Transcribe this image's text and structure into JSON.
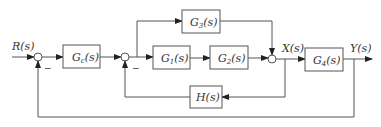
{
  "diagram": {
    "type": "block-diagram",
    "signals": {
      "input": "R(s)",
      "intermediate": "X(s)",
      "output": "Y(s)"
    },
    "blocks": {
      "gc": {
        "main": "G",
        "sub": "c",
        "arg": "(s)"
      },
      "g1": {
        "main": "G",
        "sub": "1",
        "arg": "(s)"
      },
      "g2": {
        "main": "G",
        "sub": "2",
        "arg": "(s)"
      },
      "g3": {
        "main": "G",
        "sub": "3",
        "arg": "(s)"
      },
      "g4": {
        "main": "G",
        "sub": "4",
        "arg": "(s)"
      },
      "h": {
        "main": "H",
        "sub": "",
        "arg": "(s)"
      }
    },
    "signs": {
      "sum1_feedback": "−",
      "sum2_feedback": "−"
    }
  }
}
